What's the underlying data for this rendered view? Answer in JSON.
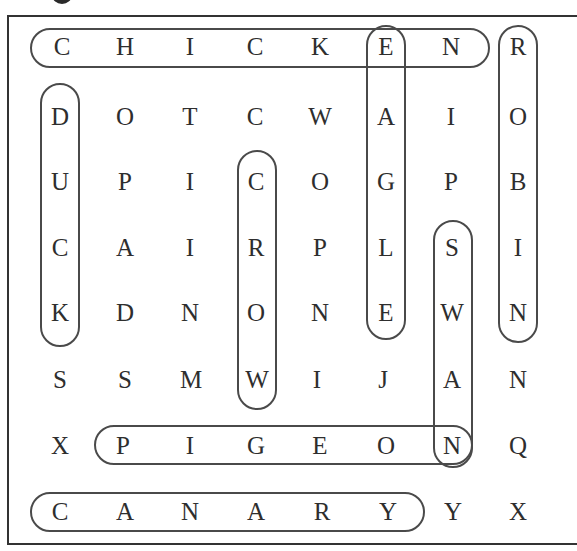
{
  "puzzle": {
    "type": "word-search",
    "rows": 8,
    "cols": 8,
    "grid": [
      [
        "C",
        "H",
        "I",
        "C",
        "K",
        "E",
        "N",
        "R"
      ],
      [
        "D",
        "O",
        "T",
        "C",
        "W",
        "A",
        "I",
        "O"
      ],
      [
        "U",
        "P",
        "I",
        "C",
        "O",
        "G",
        "P",
        "B"
      ],
      [
        "C",
        "A",
        "I",
        "R",
        "P",
        "L",
        "S",
        "I"
      ],
      [
        "K",
        "D",
        "N",
        "O",
        "N",
        "E",
        "W",
        "N"
      ],
      [
        "S",
        "S",
        "M",
        "W",
        "I",
        "J",
        "A",
        "N"
      ],
      [
        "X",
        "P",
        "I",
        "G",
        "E",
        "O",
        "N",
        "Q"
      ],
      [
        "C",
        "A",
        "N",
        "A",
        "R",
        "Y",
        "Y",
        "X"
      ]
    ],
    "found_words": [
      {
        "word": "CHICKEN",
        "direction": "horizontal",
        "start": [
          0,
          0
        ],
        "end": [
          0,
          6
        ]
      },
      {
        "word": "ROBIN",
        "direction": "vertical",
        "start": [
          0,
          7
        ],
        "end": [
          4,
          7
        ]
      },
      {
        "word": "EAGLE",
        "direction": "vertical",
        "start": [
          0,
          5
        ],
        "end": [
          4,
          5
        ]
      },
      {
        "word": "DUCK",
        "direction": "vertical",
        "start": [
          1,
          0
        ],
        "end": [
          4,
          0
        ]
      },
      {
        "word": "CROW",
        "direction": "vertical",
        "start": [
          2,
          3
        ],
        "end": [
          5,
          3
        ]
      },
      {
        "word": "SWAN",
        "direction": "vertical",
        "start": [
          3,
          6
        ],
        "end": [
          6,
          6
        ]
      },
      {
        "word": "PIGEON",
        "direction": "horizontal",
        "start": [
          6,
          1
        ],
        "end": [
          6,
          6
        ]
      },
      {
        "word": "CANARY",
        "direction": "horizontal",
        "start": [
          7,
          0
        ],
        "end": [
          7,
          5
        ]
      }
    ]
  },
  "colors": {
    "letter": "#2e2e2e",
    "outline": "#4a4a4a",
    "border": "#333333",
    "background": "#ffffff"
  }
}
